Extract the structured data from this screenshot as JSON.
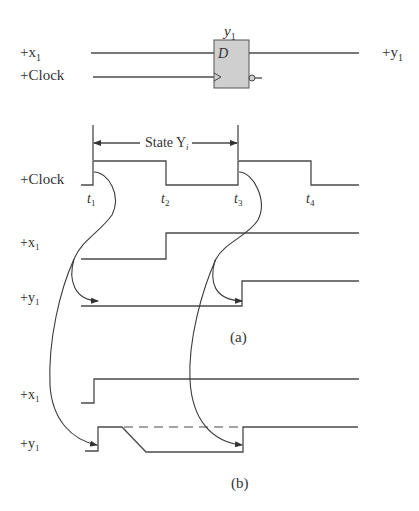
{
  "circuit": {
    "ff_name": "y",
    "ff_name_sub": "1",
    "d_label": "D",
    "input_x_label": "+x",
    "input_x_sub": "1",
    "input_clock_label": "+Clock",
    "output_label": "+y",
    "output_sub": "1",
    "ff_fill": "#cfcfcf"
  },
  "timing_a": {
    "state_label": "State Y",
    "state_sub": "i",
    "clock_label": "+Clock",
    "x_label": "+x",
    "x_sub": "1",
    "y_label": "+y",
    "y_sub": "1",
    "times": [
      {
        "t": "t",
        "sub": "1"
      },
      {
        "t": "t",
        "sub": "2"
      },
      {
        "t": "t",
        "sub": "3"
      },
      {
        "t": "t",
        "sub": "4"
      }
    ],
    "caption": "(a)"
  },
  "timing_b": {
    "x_label": "+x",
    "x_sub": "1",
    "y_label": "+y",
    "y_sub": "1",
    "caption": "(b)"
  },
  "colors": {
    "line": "#4a4a4a",
    "text": "#333333",
    "background": "#ffffff"
  }
}
